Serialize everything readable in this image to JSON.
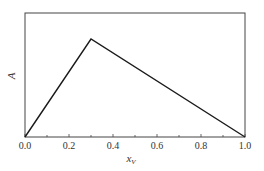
{
  "chart_data": {
    "type": "line",
    "title": "",
    "xlabel": "x_V",
    "xlabel_main": "x",
    "xlabel_sub": "V",
    "ylabel": "A",
    "xlim": [
      0.0,
      1.0
    ],
    "ylim": [
      0,
      1
    ],
    "x_ticks": [
      "0.0",
      "0.2",
      "0.4",
      "0.6",
      "0.8",
      "1.0"
    ],
    "y_ticks": [],
    "grid": false,
    "legend": null,
    "series": [
      {
        "name": "A",
        "x": [
          0.0,
          0.3,
          1.0
        ],
        "y": [
          0.0,
          0.79,
          0.0
        ],
        "color": "#1a1a1a"
      }
    ]
  }
}
